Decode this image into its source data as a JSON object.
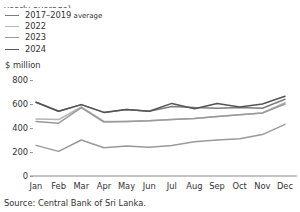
{
  "title": "yearly average)",
  "unit_label": "$ million",
  "source": "Source: Central Bank of Sri Lanka.",
  "legend": [
    {
      "label": "2017–2019",
      "suffix": " average",
      "color": "#7d7d7d"
    },
    {
      "label": "2022",
      "suffix": "",
      "color": "#b5b5b5"
    },
    {
      "label": "2023",
      "suffix": "",
      "color": "#9a9a9a"
    },
    {
      "label": "2024",
      "suffix": "",
      "color": "#555555"
    }
  ],
  "chart_data": {
    "type": "line",
    "title": "yearly average)",
    "xlabel": "",
    "ylabel": "$ million",
    "unit": "$ million",
    "ylim": [
      0,
      800
    ],
    "yticks": [
      0,
      200,
      400,
      600,
      800
    ],
    "grid": false,
    "legend_position": "top-left",
    "categories": [
      "Jan",
      "Feb",
      "Mar",
      "Apr",
      "May",
      "Jun",
      "Jul",
      "Aug",
      "Sep",
      "Oct",
      "Nov",
      "Dec"
    ],
    "series": [
      {
        "name": "2017–2019 average",
        "color": "#7d7d7d",
        "values": [
          615,
          540,
          595,
          530,
          555,
          540,
          580,
          570,
          565,
          570,
          565,
          640
        ]
      },
      {
        "name": "2022",
        "color": "#b5b5b5",
        "values": [
          475,
          470,
          575,
          455,
          455,
          460,
          470,
          480,
          495,
          510,
          525,
          610
        ]
      },
      {
        "name": "2023",
        "color": "#9a9a9a",
        "values": [
          455,
          440,
          570,
          450,
          455,
          460,
          470,
          480,
          495,
          510,
          525,
          600
        ]
      },
      {
        "name": "2024",
        "color": "#555555",
        "values": [
          615,
          540,
          595,
          530,
          555,
          540,
          605,
          560,
          605,
          575,
          600,
          665
        ]
      },
      {
        "name": "2024-low",
        "color": "#9a9a9a",
        "values": [
          255,
          205,
          300,
          235,
          250,
          240,
          255,
          285,
          300,
          310,
          345,
          430
        ]
      }
    ]
  }
}
